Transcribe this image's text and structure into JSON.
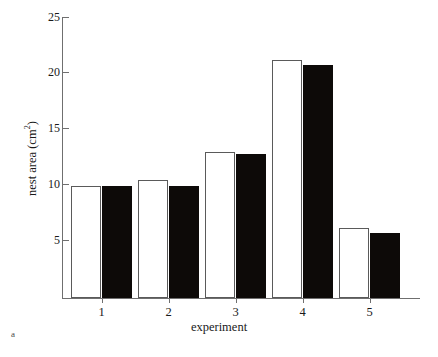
{
  "panel": {
    "label": "a"
  },
  "chart_data": {
    "type": "bar",
    "title": "",
    "xlabel": "experiment",
    "ylabel": "nest area (cm2)",
    "ylabel_base": "nest area (cm",
    "ylabel_sup": "2",
    "ylabel_close": ")",
    "categories": [
      "1",
      "2",
      "3",
      "4",
      "5"
    ],
    "ylim": [
      0,
      25
    ],
    "yticks": [
      5,
      10,
      15,
      20,
      25
    ],
    "ytick_labels": [
      "5",
      "10",
      "15",
      "20",
      "25"
    ],
    "grid": false,
    "legend": "none",
    "series": [
      {
        "name": "open",
        "fill": "#ffffff",
        "edge": "#5a5a5a",
        "values": [
          10.0,
          10.5,
          13.0,
          21.2,
          6.2
        ]
      },
      {
        "name": "filled",
        "fill": "#0d0a08",
        "edge": "#0d0a08",
        "values": [
          10.0,
          10.0,
          12.8,
          20.7,
          5.8
        ]
      }
    ]
  }
}
